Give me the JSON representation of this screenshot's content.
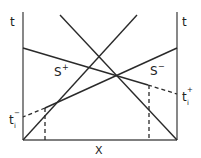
{
  "diagram": {
    "left_axis_label": "t",
    "right_axis_label": "t",
    "x_axis_label": "X",
    "s_plus_label": "S",
    "s_plus_sup": "+",
    "s_minus_label": "S",
    "s_minus_sup": "−",
    "ti_minus_label": "t",
    "ti_minus_sub": "i",
    "ti_minus_sup": "−",
    "ti_plus_label": "t",
    "ti_plus_sub": "i",
    "ti_plus_sup": "+",
    "line_color": "#2a2a2a",
    "axis_color": "#555555"
  }
}
